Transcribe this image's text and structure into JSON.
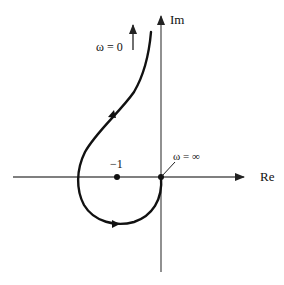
{
  "diagram": {
    "type": "nyquist-plot",
    "axes": {
      "real_label": "Re",
      "imag_label": "Im"
    },
    "labels": {
      "omega_zero": "ω = 0",
      "omega_inf": "ω = ∞",
      "critical_point": "−1"
    },
    "colors": {
      "curve": "#111111",
      "axis": "#555555",
      "background": "#ffffff"
    }
  }
}
